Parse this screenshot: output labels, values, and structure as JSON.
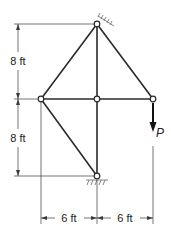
{
  "diagram": {
    "type": "truss",
    "dimensions": {
      "vertical_upper": "8 ft",
      "vertical_lower": "8 ft",
      "horizontal_left": "6 ft",
      "horizontal_right": "6 ft"
    },
    "load": {
      "label": "P",
      "direction": "down"
    },
    "supports": [
      "pin-top",
      "pin-bottom"
    ],
    "nodes": [
      "top",
      "middle-left",
      "middle-center",
      "middle-right",
      "bottom"
    ],
    "members": [
      [
        "top",
        "middle-left"
      ],
      [
        "top",
        "middle-center"
      ],
      [
        "top",
        "middle-right"
      ],
      [
        "middle-left",
        "middle-center"
      ],
      [
        "middle-center",
        "middle-right"
      ],
      [
        "middle-center",
        "bottom"
      ],
      [
        "middle-left",
        "bottom"
      ]
    ]
  }
}
